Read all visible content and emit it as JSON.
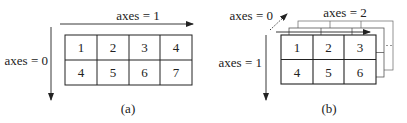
{
  "panel_a": {
    "caption": "(a)",
    "axis_horizontal_label": "axes = 1",
    "axis_vertical_label": "axes = 0",
    "rows": [
      [
        "1",
        "2",
        "3",
        "4"
      ],
      [
        "4",
        "5",
        "6",
        "7"
      ]
    ]
  },
  "panel_b": {
    "caption": "(b)",
    "axis_depth_label": "axes = 0",
    "axis_horizontal_label": "axes = 2",
    "axis_vertical_label": "axes = 1",
    "rows": [
      [
        "1",
        "2",
        "3"
      ],
      [
        "4",
        "5",
        "6"
      ]
    ]
  }
}
